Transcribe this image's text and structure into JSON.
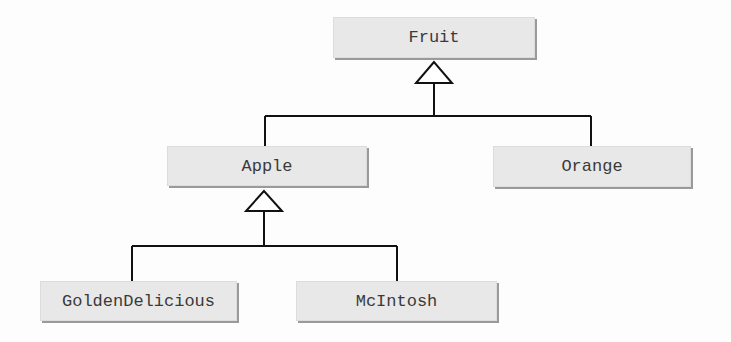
{
  "diagram": {
    "type": "class-hierarchy",
    "nodes": {
      "fruit": {
        "label": "Fruit"
      },
      "apple": {
        "label": "Apple"
      },
      "orange": {
        "label": "Orange"
      },
      "golden": {
        "label": "GoldenDelicious"
      },
      "mcintosh": {
        "label": "McIntosh"
      }
    },
    "edges": [
      {
        "from": "Apple",
        "to": "Fruit",
        "kind": "inheritance"
      },
      {
        "from": "Orange",
        "to": "Fruit",
        "kind": "inheritance"
      },
      {
        "from": "GoldenDelicious",
        "to": "Apple",
        "kind": "inheritance"
      },
      {
        "from": "McIntosh",
        "to": "Apple",
        "kind": "inheritance"
      }
    ],
    "colors": {
      "box_fill": "#e8e8e8",
      "box_shadow": "#9a9a9a",
      "line": "#111111",
      "text": "#3a3a3a"
    }
  }
}
